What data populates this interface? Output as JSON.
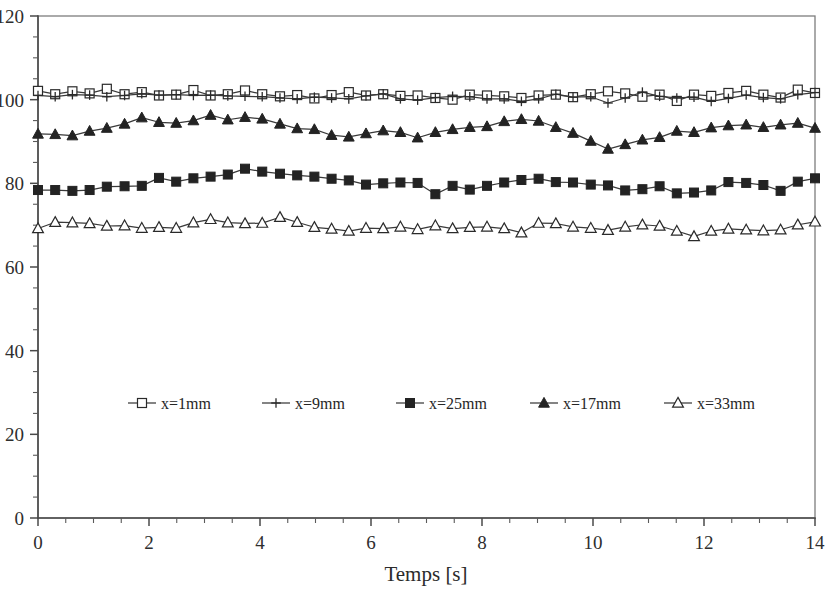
{
  "chart_data": {
    "type": "line",
    "title": "",
    "subtitle": "",
    "xlabel": "Temps [s]",
    "ylabel": "",
    "xlim": [
      0,
      14
    ],
    "ylim": [
      0,
      120
    ],
    "x_ticks": [
      0,
      2,
      4,
      6,
      8,
      10,
      12,
      14
    ],
    "x_tick_labels": [
      "0",
      "2",
      "4",
      "6",
      "8",
      "10",
      "12",
      "14"
    ],
    "x_minor_step": 0.5,
    "y_ticks": [
      0,
      20,
      40,
      60,
      80,
      100,
      120
    ],
    "y_tick_labels": [
      "0",
      "20",
      "40",
      "60",
      "80",
      "100",
      "120"
    ],
    "y_minor_step": 5,
    "grid": false,
    "legend_position": "inside-center-lower",
    "x": [
      0,
      0.31,
      0.62,
      0.93,
      1.24,
      1.56,
      1.87,
      2.18,
      2.49,
      2.8,
      3.11,
      3.42,
      3.73,
      4.04,
      4.36,
      4.67,
      4.98,
      5.29,
      5.6,
      5.91,
      6.22,
      6.53,
      6.84,
      7.16,
      7.47,
      7.78,
      8.09,
      8.4,
      8.71,
      9.02,
      9.33,
      9.64,
      9.96,
      10.27,
      10.58,
      10.89,
      11.2,
      11.51,
      11.82,
      12.13,
      12.44,
      12.76,
      13.07,
      13.38,
      13.69,
      14
    ],
    "series": [
      {
        "name": "x=1mm",
        "marker": "open-square",
        "values": [
          102.1,
          101.3,
          102.0,
          101.5,
          102.6,
          101.3,
          101.8,
          101.0,
          101.2,
          102.3,
          101.0,
          101.3,
          102.2,
          101.3,
          100.8,
          101.1,
          100.3,
          101.1,
          101.8,
          101.0,
          101.3,
          100.9,
          101.0,
          100.4,
          100.0,
          101.2,
          101.0,
          100.8,
          100.4,
          101.0,
          101.2,
          100.6,
          101.3,
          102.0,
          101.5,
          100.7,
          101.2,
          99.7,
          101.2,
          100.9,
          101.6,
          102.1,
          101.2,
          100.5,
          102.4,
          101.6
        ]
      },
      {
        "name": "x=9mm",
        "marker": "plus",
        "values": [
          101.0,
          100.7,
          101.2,
          101.1,
          100.7,
          101.0,
          101.4,
          101.1,
          101.2,
          101.0,
          101.1,
          100.9,
          100.8,
          100.7,
          100.4,
          100.2,
          100.6,
          100.4,
          100.2,
          100.9,
          101.4,
          100.2,
          99.9,
          100.5,
          100.8,
          100.7,
          100.2,
          100.2,
          99.6,
          100.2,
          101.3,
          100.6,
          100.7,
          99.2,
          100.4,
          101.8,
          100.8,
          100.4,
          100.6,
          99.6,
          100.3,
          101.1,
          100.5,
          100.2,
          101.2,
          101.7
        ]
      },
      {
        "name": "x=25mm",
        "marker": "filled-square",
        "values": [
          78.4,
          78.4,
          78.2,
          78.4,
          79.2,
          79.3,
          79.4,
          81.3,
          80.4,
          81.2,
          81.6,
          82.1,
          83.5,
          82.8,
          82.3,
          81.9,
          81.6,
          81.1,
          80.7,
          79.7,
          80.0,
          80.2,
          80.1,
          77.4,
          79.4,
          78.5,
          79.4,
          80.2,
          80.8,
          81.1,
          80.3,
          80.2,
          79.7,
          79.5,
          78.3,
          78.6,
          79.3,
          77.6,
          77.8,
          78.3,
          80.3,
          80.1,
          79.6,
          78.2,
          80.4,
          81.2
        ]
      },
      {
        "name": "x=17mm",
        "marker": "filled-triangle",
        "values": [
          91.8,
          91.7,
          91.4,
          92.5,
          93.2,
          94.2,
          95.7,
          94.6,
          94.4,
          95.0,
          96.3,
          95.2,
          95.8,
          95.4,
          94.2,
          93.1,
          92.9,
          91.5,
          91.1,
          91.9,
          92.6,
          92.2,
          90.9,
          92.2,
          92.9,
          93.4,
          93.6,
          94.8,
          95.3,
          94.9,
          93.4,
          92.0,
          90.1,
          88.2,
          89.3,
          90.4,
          91.0,
          92.5,
          92.2,
          93.3,
          93.8,
          94.0,
          93.4,
          94.0,
          94.4,
          93.2
        ]
      },
      {
        "name": "x=33mm",
        "marker": "open-triangle",
        "values": [
          69.2,
          70.7,
          70.6,
          70.4,
          69.8,
          69.9,
          69.3,
          69.5,
          69.3,
          70.6,
          71.4,
          70.6,
          70.4,
          70.5,
          71.9,
          70.7,
          69.5,
          69.1,
          68.6,
          69.3,
          69.2,
          69.6,
          69.0,
          69.9,
          69.2,
          69.5,
          69.6,
          69.2,
          68.2,
          70.5,
          70.4,
          69.6,
          69.3,
          68.8,
          69.6,
          70.1,
          69.8,
          68.6,
          67.3,
          68.6,
          69.1,
          68.9,
          68.7,
          68.9,
          70.1,
          70.8
        ]
      }
    ]
  },
  "legend": {
    "items": [
      {
        "label": "x=1mm",
        "marker": "open-square"
      },
      {
        "label": "x=9mm",
        "marker": "plus"
      },
      {
        "label": "x=25mm",
        "marker": "filled-square"
      },
      {
        "label": "x=17mm",
        "marker": "filled-triangle"
      },
      {
        "label": "x=33mm",
        "marker": "open-triangle"
      }
    ]
  },
  "colors": {
    "line": "#3a3a3a",
    "axis": "#4a4a4a",
    "text": "#2b2b2b",
    "background": "#ffffff"
  }
}
